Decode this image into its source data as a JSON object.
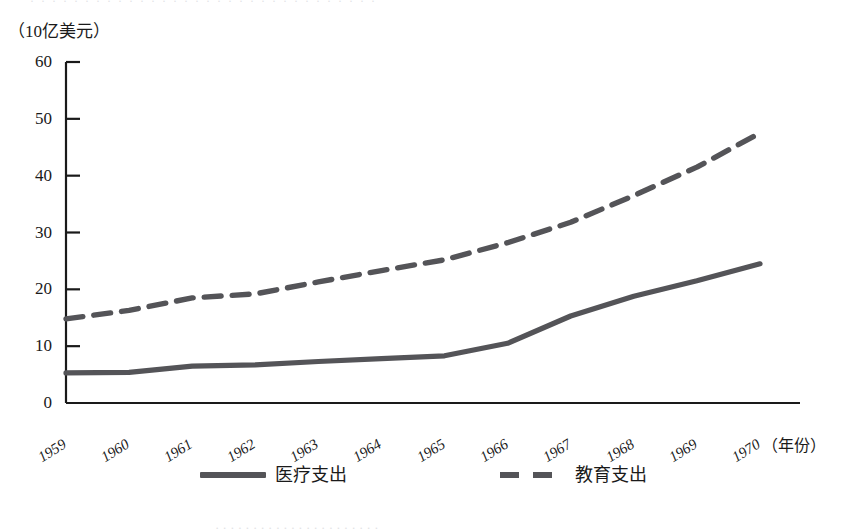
{
  "figure": {
    "unit_label": "（10亿美元）",
    "x_axis_title": "（年份）",
    "clipped_top_text": "· · ·  · · · · · · · · · ·  · · · ·   · · · · · · · · ·  · · · · · ·",
    "clipped_bottom_text": "· · · · · · · · · · · · · ·  · · · · · · · ·"
  },
  "chart_data": {
    "type": "line",
    "title": "",
    "xlabel": "（年份）",
    "ylabel": "（10亿美元）",
    "xlim": [
      1959,
      1970
    ],
    "ylim": [
      0,
      60
    ],
    "ytick_values": [
      0,
      10,
      20,
      30,
      40,
      50,
      60
    ],
    "ytick_labels": [
      "0",
      "10",
      "20",
      "30",
      "40",
      "50",
      "60"
    ],
    "categories": [
      "1959",
      "1960",
      "1961",
      "1962",
      "1963",
      "1964",
      "1965",
      "1966",
      "1967",
      "1968",
      "1969",
      "1970"
    ],
    "grid": false,
    "legend_position": "bottom",
    "series": [
      {
        "name": "医疗支出",
        "style": "solid",
        "color": "#545458",
        "values": [
          5.3,
          5.4,
          6.5,
          6.7,
          7.3,
          7.8,
          8.3,
          10.5,
          15.3,
          18.8,
          21.5,
          24.5
        ]
      },
      {
        "name": "教育支出",
        "style": "dashed",
        "color": "#545458",
        "values": [
          14.8,
          16.3,
          18.5,
          19.2,
          21.3,
          23.3,
          25.2,
          28.2,
          31.8,
          36.5,
          41.5,
          47.5
        ]
      }
    ]
  }
}
